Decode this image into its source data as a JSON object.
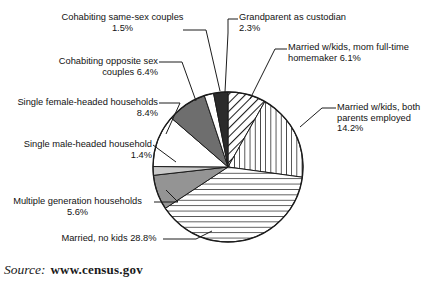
{
  "figure": {
    "source_prefix": "Source:",
    "source_url": "www.census.gov"
  },
  "chart_data": {
    "type": "pie",
    "title": "",
    "units": "percent",
    "start_angle_deg": 0,
    "direction": "clockwise",
    "legend": "callout-labels",
    "labels": [
      "Married w/kids, mom full-time homemaker",
      "Married w/kids, both parents employed",
      "Married, no kids",
      "Multiple generation households",
      "Single male-headed household",
      "Single female-headed households",
      "Cohabiting opposite sex couples",
      "Cohabiting same-sex couples",
      "Grandparent as custodian"
    ],
    "values": [
      6.1,
      14.2,
      28.8,
      5.6,
      1.4,
      8.4,
      6.4,
      1.5,
      2.3
    ],
    "slices": [
      {
        "name": "married-kids-mom-homemaker",
        "label_line1": "Married w/kids, mom full-",
        "label_line2": "time homemaker 6.1%",
        "label_text": "Married w/kids, mom full-time homemaker 6.1%",
        "value": 6.1,
        "pattern": "diagonal-hatch",
        "fill": "#ffffff"
      },
      {
        "name": "married-kids-both-employed",
        "label_line1": "Married w/kids,",
        "label_line2": "both parents",
        "label_line3": "employed 14.2%",
        "label_text": "Married w/kids, both parents employed 14.2%",
        "value": 14.2,
        "pattern": "vertical-lines",
        "fill": "#ffffff"
      },
      {
        "name": "married-no-kids",
        "label_line1": "Married, no",
        "label_line2": "kids 28.8%",
        "label_text": "Married, no kids 28.8%",
        "value": 28.8,
        "pattern": "horizontal-lines",
        "fill": "#ffffff"
      },
      {
        "name": "multiple-generation-households",
        "label_line1": "Multiple generation",
        "label_line2": "households 5.6%",
        "label_text": "Multiple generation households 5.6%",
        "value": 5.6,
        "pattern": "solid",
        "fill": "#949494"
      },
      {
        "name": "single-male-headed-household",
        "label_line1": "Single male-",
        "label_line2": "headed",
        "label_line3": "household 1.4%",
        "label_text": "Single male-headed household 1.4%",
        "value": 1.4,
        "pattern": "solid",
        "fill": "#c9c9c9"
      },
      {
        "name": "single-female-headed-households",
        "label_line1": "Single female-",
        "label_line2": "headed",
        "label_line3": "households 8.4%",
        "label_text": "Single female-headed households 8.4%",
        "value": 8.4,
        "pattern": "solid",
        "fill": "#ffffff"
      },
      {
        "name": "cohabiting-opposite-sex-couples",
        "label_line1": "Cohabiting",
        "label_line2": "opposite sex",
        "label_line3": "couples 6.4%",
        "label_text": "Cohabiting opposite sex couples 6.4%",
        "value": 6.4,
        "pattern": "solid",
        "fill": "#6e6e6e"
      },
      {
        "name": "cohabiting-same-sex-couples",
        "label_line1": "Cohabiting",
        "label_line2": "same-sex",
        "label_line3": "couples 1.5%",
        "label_text": "Cohabiting same-sex couples 1.5%",
        "value": 1.5,
        "pattern": "solid",
        "fill": "#ffffff"
      },
      {
        "name": "grandparent-as-custodian",
        "label_line1": "Grandparent",
        "label_line2": "as custodian 2.3%",
        "label_text": "Grandparent as custodian 2.3%",
        "value": 2.3,
        "pattern": "solid",
        "fill": "#2b2b2b"
      }
    ]
  }
}
